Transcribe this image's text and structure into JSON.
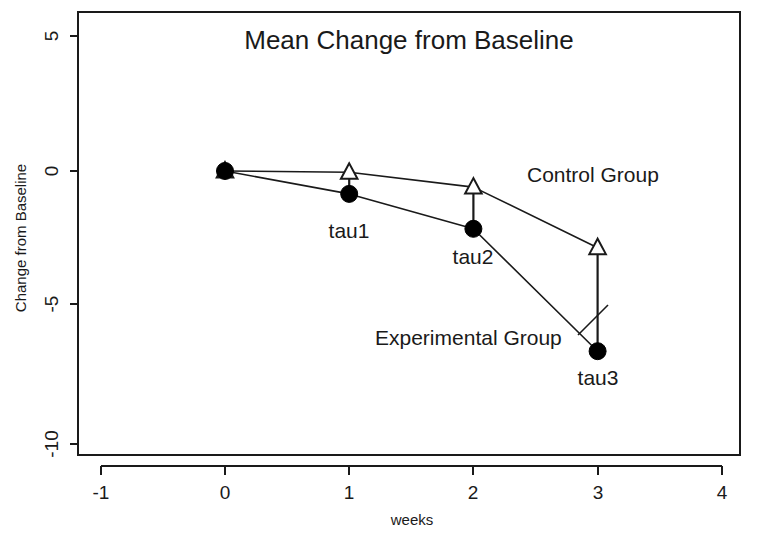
{
  "chart_data": {
    "type": "line",
    "title": "Mean Change from Baseline",
    "xlabel": "weeks",
    "ylabel": "Change from Baseline",
    "xlim": [
      -1.5,
      4.3
    ],
    "ylim": [
      -11.2,
      5.6
    ],
    "xticks": [
      "-1",
      "0",
      "1",
      "2",
      "3",
      "4"
    ],
    "xtick_values": [
      -1,
      0,
      1,
      2,
      3,
      4
    ],
    "yticks": [
      "5",
      "0",
      "-5",
      "-10"
    ],
    "ytick_values": [
      5,
      0,
      -5,
      -10
    ],
    "grid": false,
    "legend_position": "inline-annotation",
    "x": [
      0,
      1,
      2,
      3
    ],
    "series": [
      {
        "name": "Control Group",
        "marker": "open-triangle",
        "values": [
          0,
          -0.05,
          -0.6,
          -2.85
        ]
      },
      {
        "name": "Experimental Group",
        "marker": "filled-circle",
        "values": [
          0,
          -0.85,
          -2.15,
          -6.7
        ]
      }
    ],
    "annotations": [
      {
        "label": "tau1",
        "x": 1,
        "y": -2.3
      },
      {
        "label": "tau2",
        "x": 2,
        "y": -3.25
      },
      {
        "label": "tau3",
        "x": 3,
        "y": -7.75
      },
      {
        "label": "Control Group",
        "x": 2.43,
        "y": -0.15
      },
      {
        "label": "Experimental Group",
        "x": 1.22,
        "y": -6.25
      }
    ],
    "arrows": [
      {
        "at_x": 1,
        "from_y": -0.85,
        "to_y": -0.05
      },
      {
        "at_x": 2,
        "from_y": -2.15,
        "to_y": -0.6
      },
      {
        "at_x": 3,
        "from_y": -6.7,
        "to_y": -2.85
      }
    ]
  },
  "labels": {
    "title": "Mean Change from Baseline",
    "xaxis_title": "weeks",
    "yaxis_title": "Change from Baseline",
    "tau1": "tau1",
    "tau2": "tau2",
    "tau3": "tau3",
    "control_group": "Control Group",
    "experimental_group": "Experimental Group",
    "xtick_neg1": "-1",
    "xtick_0": "0",
    "xtick_1": "1",
    "xtick_2": "2",
    "xtick_3": "3",
    "xtick_4": "4",
    "ytick_5": "5",
    "ytick_0": "0",
    "ytick_neg5": "-5",
    "ytick_neg10": "-10"
  },
  "colors": {
    "foreground": "#1a1a1a",
    "background": "#ffffff",
    "marker_fill": "#000000",
    "marker_open": "#ffffff"
  }
}
